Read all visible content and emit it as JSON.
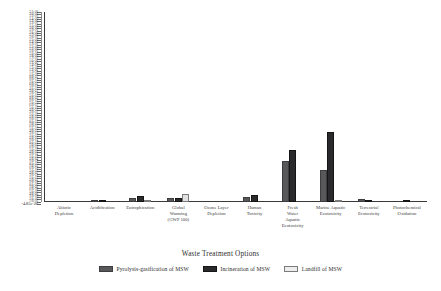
{
  "chart_data": {
    "type": "bar",
    "title": "",
    "xlabel": "Waste Treatment Options",
    "ylabel": "",
    "ylim": [
      -4.85e-26,
      3.7e-20
    ],
    "grid": false,
    "legend_position": "bottom",
    "categories": [
      "Abiotic Depletion",
      "Acidification",
      "Eutrophication",
      "Global Warming (GWP 100)",
      "Ozone Layer Depletion",
      "Human Toxicity",
      "Fresh Water Aquatic Ecotoxicity",
      "Marine Aquatic Ecotoxicity",
      "Terrestrial Ecotoxicity",
      "Photochemical Oxidation"
    ],
    "series": [
      {
        "name": "Pyrolysis-gasification of MSW",
        "color": "#58585a",
        "values": [
          0.0,
          0.1,
          2.1,
          2.0,
          0.0,
          2.4,
          21.5,
          16.7,
          1.6,
          0.0
        ]
      },
      {
        "name": "Incineration of MSW",
        "color": "#2a2a2c",
        "values": [
          0.0,
          0.6,
          3.4,
          2.0,
          0.0,
          3.7,
          27.6,
          37.0,
          0.4,
          0.3
        ]
      },
      {
        "name": "Landfill of MSW",
        "color": "#e2e2e2",
        "values": [
          0.0,
          0.0,
          0.2,
          4.0,
          0.0,
          0.0,
          0.0,
          0.2,
          0.0,
          0.0
        ]
      }
    ],
    "value_units": "percent of plot height (bar tops read from axis)",
    "y_axis_top_label": "3.7e-20",
    "y_axis_bottom_label": "-4.85e-26",
    "y_tick_labels": [
      "3.7e-20",
      "3.6e-20",
      "3.5e-20",
      "3.4e-20",
      "3.3e-20",
      "3.2e-20",
      "3.1e-20",
      "3.0e-20",
      "2.9e-20",
      "2.8e-20",
      "2.7e-20",
      "2.6e-20",
      "2.5e-20",
      "2.4e-20",
      "2.3e-20",
      "2.2e-20",
      "2.1e-20",
      "2.0e-20",
      "1.9e-20",
      "1.8e-20",
      "1.7e-20",
      "1.6e-20",
      "1.5e-20",
      "1.4e-20",
      "1.3e-20",
      "1.2e-20",
      "1.1e-20",
      "1.0e-20",
      "9.0e-21",
      "8.0e-21",
      "7.0e-21",
      "6.0e-21",
      "5.0e-21",
      "4.0e-21",
      "3.0e-21",
      "2.0e-21",
      "1.0e-21",
      "9.0e-22",
      "8.0e-22",
      "7.0e-22",
      "6.0e-22",
      "5.0e-22",
      "4.0e-22",
      "3.0e-22",
      "2.0e-22",
      "1.0e-22",
      "9.0e-23",
      "8.0e-23",
      "7.0e-23",
      "6.0e-23",
      "5.0e-23",
      "4.0e-23",
      "3.0e-23",
      "2.0e-23",
      "1.0e-23",
      "9.0e-24",
      "8.0e-24",
      "7.0e-24",
      "6.0e-24",
      "5.0e-24",
      "4.0e-24",
      "3.0e-24",
      "2.0e-24",
      "1.0e-24",
      "9.0e-25",
      "8.0e-25",
      "7.0e-25",
      "6.0e-25",
      "5.0e-25",
      "4.0e-25",
      "3.0e-25",
      "2.0e-25",
      "1.0e-25",
      "9.0e-26",
      "8.0e-26",
      "7.0e-26",
      "6.0e-26",
      "5.0e-26",
      "4.0e-26",
      "3.0e-26",
      "2.0e-26",
      "1.0e-26",
      "-4.85e-26"
    ]
  },
  "legend": {
    "items": [
      {
        "label": "Pyrolysis-gasification  of  MSW",
        "swatch": "pyro"
      },
      {
        "label": "Incineration of  MSW",
        "swatch": "incin"
      },
      {
        "label": "Landfill of MSW",
        "swatch": "land"
      }
    ]
  },
  "axis": {
    "x_title": "Waste Treatment Options"
  },
  "x_categories_display": [
    [
      "Abiotic",
      "Depletion"
    ],
    [
      "Acidification"
    ],
    [
      "Eutrophication"
    ],
    [
      "Global",
      "Warming",
      "(GWP  100)"
    ],
    [
      "Ozone  Layer",
      "Depletion"
    ],
    [
      "Human",
      "Toxicity"
    ],
    [
      "Fresh",
      "Water",
      "Aquatic",
      "Ecotoxicity"
    ],
    [
      "Marine  Aquatic",
      "Ecotoxicity"
    ],
    [
      "Terrestrial",
      "Ecotoxicity"
    ],
    [
      "Photochemical",
      "Oxidation"
    ]
  ]
}
